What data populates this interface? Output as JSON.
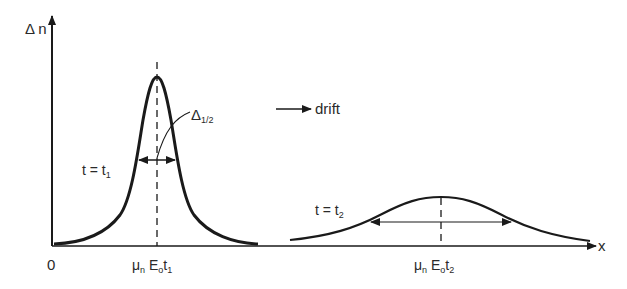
{
  "figure": {
    "y_axis_label": "Δ n",
    "x_axis_label": "x",
    "origin_label": "0",
    "drift_label": "drift",
    "pulse1": {
      "time_label": "t = t",
      "time_sub": "1",
      "position_label_mu": "μ",
      "position_label_n": "n",
      "position_label_E": " E",
      "position_label_o": "o",
      "position_label_t": "t",
      "position_sub": "1"
    },
    "pulse2": {
      "time_label": "t = t",
      "time_sub": "2",
      "position_label_mu": "μ",
      "position_label_n": "n",
      "position_label_E": " E",
      "position_label_o": "o",
      "position_label_t": "t",
      "position_sub": "2"
    },
    "halfwidth_label": "Δ",
    "halfwidth_sub": "1/2",
    "colors": {
      "line": "#1a1a1a",
      "text": "#2a2a2a",
      "background": "#ffffff"
    }
  }
}
